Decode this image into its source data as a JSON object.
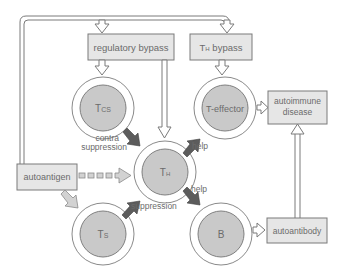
{
  "diagram": {
    "boxes": {
      "regulatory_bypass": "regulatory bypass",
      "th_bypass_main": "T",
      "th_bypass_sub": "H",
      "th_bypass_rest": " bypass",
      "autoantigen": "autoantigen",
      "autoimmune_line1": "autoimmune",
      "autoimmune_line2": "disease",
      "autoantibody": "autoantibody"
    },
    "cells": {
      "tcs_main": "T",
      "tcs_sub": "CS",
      "t_effector": "T-effector",
      "th_main": "T",
      "th_sub": "H",
      "ts_main": "T",
      "ts_sub": "S",
      "b": "B"
    },
    "arrow_labels": {
      "contra_line1": "contra",
      "contra_line2": "suppression",
      "help_effector": "help",
      "help_b": "help",
      "suppression": "suppression"
    },
    "colors": {
      "box_fill": "#e6e6e6",
      "cell_fill": "#c9c9c9",
      "dark_arrow": "#5c5c5c",
      "light_arrow": "#d2d2d2",
      "text": "#6b6b6b"
    }
  }
}
